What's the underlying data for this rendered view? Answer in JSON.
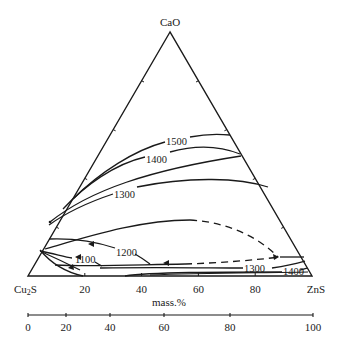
{
  "diagram": {
    "type": "ternary-phase-diagram",
    "vertices": {
      "top": "CaO",
      "left": "Cu2S",
      "left_base": "Cu",
      "left_sub": "2",
      "left_tail": "S",
      "right": "ZnS"
    },
    "base_axis": {
      "ticks": [
        "20",
        "40",
        "60",
        "80"
      ]
    },
    "unit_label": "mass.%",
    "scale_bar": {
      "ticks": [
        "0",
        "20",
        "40",
        "60",
        "80",
        "100"
      ]
    },
    "isotherms": [
      {
        "label": "1500",
        "unit": "°C"
      },
      {
        "label": "1400",
        "unit": "°C"
      },
      {
        "label": "1300",
        "unit": "°C"
      },
      {
        "label": "1200",
        "unit": "°C"
      },
      {
        "label": "1100",
        "unit": "°C"
      },
      {
        "label": "1300",
        "unit": "°C",
        "position": "lower-right"
      },
      {
        "label": "1400",
        "unit": "°C",
        "position": "lower-right"
      }
    ],
    "colors": {
      "line": "#1a1a1a",
      "background": "#ffffff"
    }
  }
}
